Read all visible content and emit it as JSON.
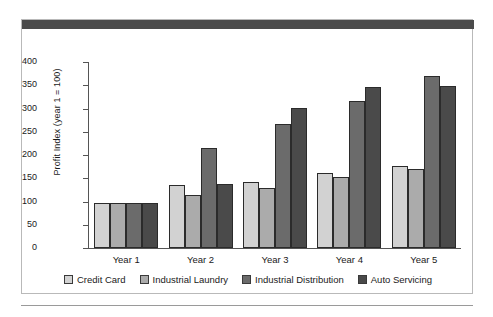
{
  "chart_data": {
    "type": "bar",
    "title": "",
    "xlabel": "",
    "ylabel": "Profit Index (year 1 = 100)",
    "ylim": [
      0,
      400
    ],
    "ytick_values": [
      400,
      350,
      300,
      250,
      200,
      150,
      100,
      50,
      0
    ],
    "ytick_labels": [
      "400",
      "350",
      "300",
      "250",
      "200",
      "150",
      "100",
      "50",
      "0"
    ],
    "categories": [
      "Year 1",
      "Year 2",
      "Year 3",
      "Year 4",
      "Year 5"
    ],
    "grid": false,
    "legend_position": "bottom",
    "series": [
      {
        "name": "Credit Card",
        "color": "#d2d2d2",
        "values": [
          96,
          136,
          143,
          161,
          177
        ]
      },
      {
        "name": "Industrial Laundry",
        "color": "#ababab",
        "values": [
          96,
          113,
          130,
          152,
          171
        ]
      },
      {
        "name": "Industrial Distribution",
        "color": "#6b6b6b",
        "values": [
          96,
          215,
          266,
          316,
          370
        ]
      },
      {
        "name": "Auto Servicing",
        "color": "#4a4a4a",
        "values": [
          96,
          138,
          302,
          347,
          349
        ]
      }
    ]
  },
  "figure": {
    "title_bar_color": "#4b4b4b",
    "frame_border_color": "#b9b9b9",
    "background_color": "#ffffff"
  }
}
